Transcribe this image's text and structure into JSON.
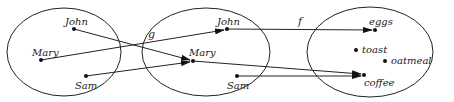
{
  "diagram": {
    "sets": [
      {
        "id": "set-a",
        "cx": 64,
        "cy": 52,
        "rx": 57,
        "ry": 44
      },
      {
        "id": "set-b",
        "cx": 206,
        "cy": 52,
        "rx": 64,
        "ry": 44
      },
      {
        "id": "set-c",
        "cx": 370,
        "cy": 52,
        "rx": 63,
        "ry": 45
      }
    ],
    "elements": {
      "a_john": {
        "label": "John",
        "x": 74,
        "y": 29
      },
      "a_mary": {
        "label": "Mary",
        "x": 41,
        "y": 60
      },
      "a_sam": {
        "label": "Sam",
        "x": 86,
        "y": 76
      },
      "b_john": {
        "label": "John",
        "x": 227,
        "y": 29
      },
      "b_mary": {
        "label": "Mary",
        "x": 193,
        "y": 61
      },
      "b_sam": {
        "label": "Sam",
        "x": 237,
        "y": 76
      },
      "c_eggs": {
        "label": "eggs",
        "x": 375,
        "y": 30
      },
      "c_toast": {
        "label": "toast",
        "x": 356,
        "y": 50
      },
      "c_oatmeal": {
        "label": "oatmeal",
        "x": 385,
        "y": 61
      },
      "c_coffee": {
        "label": "coffee",
        "x": 364,
        "y": 75
      }
    },
    "function_labels": {
      "g": "g",
      "f": "f"
    },
    "mappings_g": [
      {
        "from": "John",
        "to": "Mary"
      },
      {
        "from": "Mary",
        "to": "John"
      },
      {
        "from": "Sam",
        "to": "Mary"
      }
    ],
    "mappings_f": [
      {
        "from": "John",
        "to": "eggs"
      },
      {
        "from": "Mary",
        "to": "coffee"
      },
      {
        "from": "Sam",
        "to": "coffee"
      }
    ]
  }
}
